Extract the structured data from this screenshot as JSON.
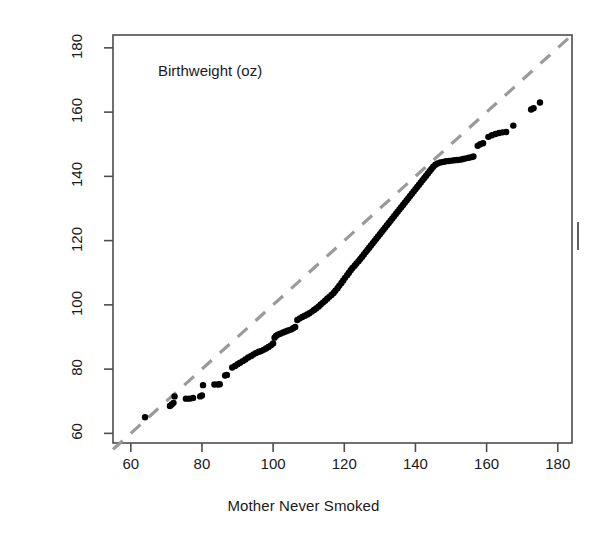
{
  "figure": {
    "title": "Birthweight (oz)",
    "xlabel": "Mother Never Smoked",
    "ylabel": "Mother Smoked While Pregnant",
    "point_color": "#000000",
    "reference_line_color": "#9a9a9a",
    "frame_color": "#4d4d4d",
    "background": "#ffffff"
  },
  "chart_data": {
    "type": "scatter",
    "title": "Birthweight (oz)",
    "xlabel": "Mother Never Smoked",
    "ylabel": "Mother Smoked While Pregnant",
    "xlim": [
      55,
      184
    ],
    "ylim": [
      57,
      184
    ],
    "xticks": [
      60,
      80,
      100,
      120,
      140,
      160,
      180
    ],
    "yticks": [
      60,
      80,
      100,
      120,
      140,
      160,
      180
    ],
    "xtick_labels": [
      "60",
      "80",
      "100",
      "120",
      "140",
      "160",
      "180"
    ],
    "ytick_labels": [
      "60",
      "80",
      "100",
      "120",
      "140",
      "160",
      "180"
    ],
    "grid": false,
    "legend": null,
    "annotations": [
      {
        "text": "Birthweight (oz)",
        "x": 73,
        "y": 173
      }
    ],
    "reference_line": {
      "type": "identity",
      "style": "dashed",
      "color": "#9a9a9a",
      "x": [
        55,
        184
      ],
      "y": [
        55,
        184
      ]
    },
    "series": [
      {
        "name": "quantile-quantile points",
        "marker": "filled-circle",
        "color": "#000000",
        "points": [
          [
            64.0,
            65.0
          ],
          [
            71.0,
            68.5
          ],
          [
            71.5,
            69.0
          ],
          [
            72.0,
            69.5
          ],
          [
            72.3,
            71.5
          ],
          [
            75.5,
            70.8
          ],
          [
            76.5,
            70.8
          ],
          [
            77.5,
            71.0
          ],
          [
            79.5,
            71.5
          ],
          [
            80.0,
            71.8
          ],
          [
            80.3,
            75.0
          ],
          [
            83.5,
            75.2
          ],
          [
            84.5,
            75.2
          ],
          [
            85.0,
            75.3
          ],
          [
            86.5,
            78.0
          ],
          [
            87.0,
            78.2
          ],
          [
            88.5,
            80.5
          ],
          [
            89.3,
            81.0
          ],
          [
            90.0,
            81.5
          ],
          [
            90.7,
            82.0
          ],
          [
            91.5,
            82.5
          ],
          [
            92.2,
            83.0
          ],
          [
            93.0,
            83.6
          ],
          [
            93.8,
            84.1
          ],
          [
            94.5,
            84.6
          ],
          [
            95.2,
            85.0
          ],
          [
            96.0,
            85.4
          ],
          [
            96.6,
            85.6
          ],
          [
            97.3,
            86.0
          ],
          [
            98.0,
            86.4
          ],
          [
            98.7,
            86.9
          ],
          [
            99.4,
            87.4
          ],
          [
            100.0,
            88.0
          ],
          [
            100.4,
            89.8
          ],
          [
            100.8,
            90.3
          ],
          [
            101.3,
            90.7
          ],
          [
            102.0,
            91.0
          ],
          [
            102.8,
            91.4
          ],
          [
            103.5,
            91.7
          ],
          [
            104.2,
            92.0
          ],
          [
            105.0,
            92.3
          ],
          [
            105.6,
            92.7
          ],
          [
            106.2,
            93.1
          ],
          [
            106.8,
            95.3
          ],
          [
            107.5,
            95.8
          ],
          [
            108.2,
            96.2
          ],
          [
            108.9,
            96.6
          ],
          [
            109.6,
            97.0
          ],
          [
            110.2,
            97.4
          ],
          [
            110.9,
            97.9
          ],
          [
            111.5,
            98.4
          ],
          [
            112.1,
            98.9
          ],
          [
            112.8,
            99.5
          ],
          [
            113.4,
            100.1
          ],
          [
            114.0,
            100.7
          ],
          [
            114.6,
            101.3
          ],
          [
            115.2,
            101.9
          ],
          [
            115.8,
            102.5
          ],
          [
            116.4,
            103.1
          ],
          [
            117.0,
            103.7
          ],
          [
            117.5,
            104.4
          ],
          [
            118.1,
            105.2
          ],
          [
            118.6,
            106.0
          ],
          [
            119.2,
            106.8
          ],
          [
            119.7,
            107.6
          ],
          [
            120.2,
            108.4
          ],
          [
            120.8,
            109.2
          ],
          [
            121.3,
            110.0
          ],
          [
            121.8,
            110.8
          ],
          [
            122.3,
            111.5
          ],
          [
            122.9,
            112.2
          ],
          [
            123.4,
            112.9
          ],
          [
            124.0,
            113.6
          ],
          [
            124.5,
            114.3
          ],
          [
            125.0,
            115.0
          ],
          [
            125.5,
            115.7
          ],
          [
            126.0,
            116.4
          ],
          [
            126.5,
            117.1
          ],
          [
            127.0,
            117.8
          ],
          [
            127.5,
            118.5
          ],
          [
            128.0,
            119.2
          ],
          [
            128.5,
            119.9
          ],
          [
            129.0,
            120.6
          ],
          [
            129.5,
            121.3
          ],
          [
            130.0,
            122.0
          ],
          [
            130.5,
            122.7
          ],
          [
            131.0,
            123.4
          ],
          [
            131.5,
            124.1
          ],
          [
            132.0,
            124.8
          ],
          [
            132.5,
            125.5
          ],
          [
            133.0,
            126.2
          ],
          [
            133.5,
            126.9
          ],
          [
            134.0,
            127.6
          ],
          [
            134.5,
            128.3
          ],
          [
            135.0,
            129.0
          ],
          [
            135.5,
            129.7
          ],
          [
            136.0,
            130.4
          ],
          [
            136.5,
            131.1
          ],
          [
            137.0,
            131.8
          ],
          [
            137.5,
            132.5
          ],
          [
            138.0,
            133.2
          ],
          [
            138.5,
            133.9
          ],
          [
            139.0,
            134.6
          ],
          [
            139.5,
            135.3
          ],
          [
            140.0,
            136.0
          ],
          [
            140.5,
            136.7
          ],
          [
            141.0,
            137.4
          ],
          [
            141.5,
            138.1
          ],
          [
            142.0,
            138.8
          ],
          [
            142.5,
            139.5
          ],
          [
            143.0,
            140.2
          ],
          [
            143.5,
            140.9
          ],
          [
            144.0,
            141.6
          ],
          [
            144.5,
            142.3
          ],
          [
            145.0,
            143.0
          ],
          [
            145.6,
            143.6
          ],
          [
            146.2,
            144.0
          ],
          [
            147.0,
            144.3
          ],
          [
            147.8,
            144.5
          ],
          [
            148.6,
            144.7
          ],
          [
            149.4,
            144.8
          ],
          [
            150.2,
            144.9
          ],
          [
            151.0,
            145.0
          ],
          [
            151.8,
            145.1
          ],
          [
            152.6,
            145.2
          ],
          [
            153.4,
            145.4
          ],
          [
            154.2,
            145.6
          ],
          [
            155.0,
            145.8
          ],
          [
            155.8,
            146.0
          ],
          [
            156.3,
            146.2
          ],
          [
            157.5,
            149.5
          ],
          [
            158.2,
            150.0
          ],
          [
            159.0,
            150.3
          ],
          [
            160.5,
            152.3
          ],
          [
            161.5,
            152.8
          ],
          [
            162.5,
            153.2
          ],
          [
            163.5,
            153.5
          ],
          [
            164.5,
            153.7
          ],
          [
            165.5,
            153.8
          ],
          [
            167.5,
            155.8
          ],
          [
            172.5,
            160.8
          ],
          [
            173.2,
            161.2
          ],
          [
            175.0,
            163.0
          ]
        ]
      }
    ]
  },
  "marks": {
    "right_edge_tick": "right-edge-tick-artifact"
  }
}
